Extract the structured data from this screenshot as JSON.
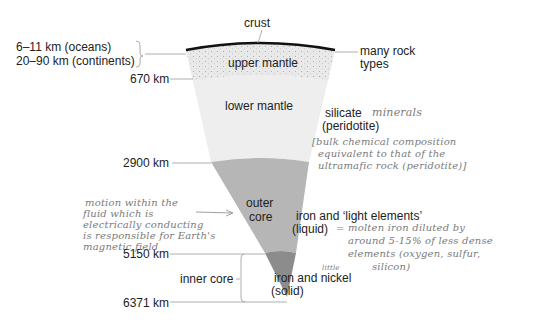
{
  "layers": {
    "crust": "crust",
    "upper_mantle": "upper mantle",
    "lower_mantle": "lower mantle",
    "outer_core_line1": "outer",
    "outer_core_line2": "core",
    "inner_core": "inner core"
  },
  "depths": {
    "crust_oceans": "6–11 km (oceans)",
    "crust_continents": "20–90 km (continents)",
    "d670": "670 km",
    "d2900": "2900 km",
    "d5150": "5150 km",
    "d6371": "6371 km"
  },
  "compositions": {
    "crust_line1": "many rock",
    "crust_line2": "types",
    "mantle_line1": "silicate",
    "mantle_line2": "(peridotite)",
    "outer_core_line1": "iron and ‘light elements’",
    "outer_core_line2": "(liquid)",
    "inner_core_line1": "iron and nickel",
    "inner_core_line2": "(solid)"
  },
  "handwritten_notes": {
    "minerals": "minerals",
    "bulk_line1": "[bulk chemical composition",
    "bulk_line2": "equivalent to that of the",
    "bulk_line3": "ultramafic rock (peridotite)]",
    "motion_line1": "motion within the",
    "motion_line2": "fluid which is",
    "motion_line3": "electrically conducting",
    "motion_line4": "is responsible for Earth's",
    "motion_line5": "magnetic field",
    "molten_eq": "=",
    "molten_line1": "molten iron diluted by",
    "molten_line2": "around 5-15% of less dense",
    "molten_line3": "elements (oxygen, sulfur,",
    "molten_line4": "silicon)",
    "little": "little"
  },
  "colors": {
    "crust": "#111111",
    "upper_mantle": "#e6e6e6",
    "lower_mantle": "#ededed",
    "outer_core": "#b4b4b4",
    "inner_core": "#8a8a8a",
    "leader_lines": "#9a9a9a",
    "handwriting": "#7a7a7a"
  }
}
